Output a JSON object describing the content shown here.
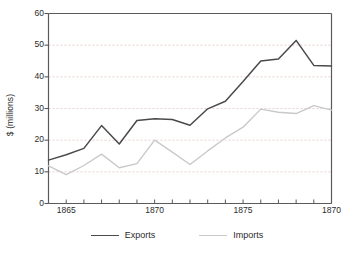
{
  "chart_data": {
    "type": "line",
    "title": "",
    "xlabel": "",
    "ylabel": "$ (millions)",
    "ylim": [
      0,
      60
    ],
    "yticks": [
      0,
      10,
      20,
      30,
      40,
      50,
      60
    ],
    "grid": "horizontal-dashed",
    "legend_position": "bottom-center",
    "x_tick_labels": [
      {
        "value": 1865,
        "label": "1865"
      },
      {
        "value": 1870,
        "label": "1870"
      },
      {
        "value": 1875,
        "label": "1875"
      },
      {
        "value": 1880,
        "label": "1870"
      }
    ],
    "x": [
      1864,
      1865,
      1866,
      1867,
      1868,
      1869,
      1870,
      1871,
      1872,
      1873,
      1874,
      1875,
      1876,
      1877,
      1878,
      1879,
      1880
    ],
    "series": [
      {
        "name": "Exports",
        "color": "#4a4a4a",
        "values": [
          13.7,
          15.4,
          17.4,
          24.6,
          18.8,
          26.2,
          26.8,
          26.5,
          24.7,
          29.9,
          32.3,
          38.5,
          45.0,
          45.6,
          51.5,
          43.6,
          43.4
        ]
      },
      {
        "name": "Imports",
        "color": "#c9c9c9",
        "values": [
          11.9,
          9.1,
          12.0,
          15.6,
          11.3,
          12.6,
          20.0,
          16.2,
          12.3,
          16.6,
          20.7,
          24.1,
          29.8,
          28.8,
          28.4,
          30.9,
          29.5
        ]
      }
    ]
  },
  "legend": {
    "items": [
      {
        "label": "Exports",
        "color": "#4a4a4a"
      },
      {
        "label": "Imports",
        "color": "#c9c9c9"
      }
    ]
  },
  "colors": {
    "exports_line": "#4a4a4a",
    "imports_line": "#c9c9c9",
    "gridline": "#e8c9c9",
    "axis": "#5a5a5a",
    "text": "#2b2b2b",
    "background": "#ffffff"
  }
}
